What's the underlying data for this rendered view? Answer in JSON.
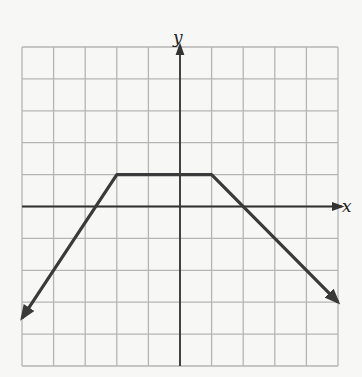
{
  "chart_data": {
    "type": "line",
    "title": "",
    "xlabel": "x",
    "ylabel": "y",
    "xlim": [
      -5,
      5
    ],
    "ylim": [
      -5,
      5
    ],
    "grid": true,
    "grid_step": 1,
    "tick_labels": false,
    "series": [
      {
        "name": "piecewise-linear",
        "color": "#3a3a3a",
        "x": [
          -5,
          -2,
          1,
          5
        ],
        "y": [
          -3.5,
          1,
          1,
          -3
        ],
        "arrow_start": true,
        "arrow_end": true
      }
    ]
  },
  "labels": {
    "x_axis": "x",
    "y_axis": "y"
  },
  "colors": {
    "grid": "#b5b5b5",
    "axis": "#333333",
    "line": "#3a3a3a",
    "background": "#f7f7f5"
  }
}
